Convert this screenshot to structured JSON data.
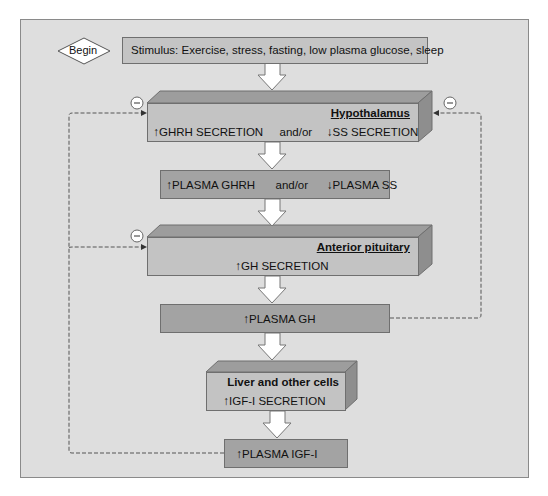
{
  "diagram": {
    "begin_label": "Begin",
    "stimulus": "Stimulus: Exercise, stress, fasting, low plasma glucose, sleep",
    "hypothalamus": {
      "title": "Hypothalamus",
      "left_arrow": "↑",
      "left_text": "GHRH SECRETION",
      "connector": "and/or",
      "right_arrow": "↓",
      "right_text": "SS SECRETION"
    },
    "plasma_ghrh": {
      "left_arrow": "↑",
      "left_text": "PLASMA GHRH",
      "connector": "and/or",
      "right_arrow": "↓",
      "right_text": "PLASMA SS"
    },
    "anterior_pituitary": {
      "title": "Anterior pituitary",
      "arrow": "↑",
      "text": "GH SECRETION"
    },
    "plasma_gh": {
      "arrow": "↑",
      "text": "PLASMA GH"
    },
    "liver": {
      "title": "Liver and other cells",
      "arrow": "↑",
      "text": "IGF-I SECRETION"
    },
    "plasma_igf": {
      "arrow": "↑",
      "text": "PLASMA IGF-I"
    },
    "inhibition_symbol": "−",
    "feedback_loops": [
      {
        "from": "PLASMA IGF-I",
        "to": "Hypothalamus",
        "effect": "−"
      },
      {
        "from": "PLASMA IGF-I",
        "to": "Anterior pituitary",
        "effect": "−"
      },
      {
        "from": "PLASMA GH",
        "to": "Hypothalamus",
        "effect": "−"
      }
    ]
  },
  "colors": {
    "panel_bg": "#dedede",
    "box_light": "#c4c4c4",
    "box_dark": "#a3a3a3",
    "box_top": "#9a9a9a",
    "box_side": "#8e8e8e",
    "arrow_fill": "#ffffff",
    "dashed_line": "#555555"
  }
}
